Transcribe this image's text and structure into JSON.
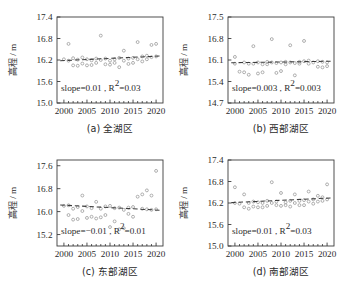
{
  "figure": {
    "panel_count": 4,
    "shared_ylabel": "高程 / m",
    "shared_xticks": [
      "2000",
      "2005",
      "2010",
      "2015",
      "2020"
    ]
  },
  "chart_data": [
    {
      "type": "scatter",
      "panel_id": "a",
      "caption": "(a) 全湖区",
      "title": "",
      "xlabel": "",
      "ylabel": "高程 / m",
      "xlim": [
        1998.5,
        2021.5
      ],
      "ylim": [
        15.0,
        17.4
      ],
      "xticks": [
        2000,
        2005,
        2010,
        2015,
        2020
      ],
      "xticklabels": [
        "2000",
        "2005",
        "2010",
        "2015",
        "2020"
      ],
      "yticks": [
        15.0,
        15.6,
        16.2,
        16.8,
        17.4
      ],
      "yticklabels": [
        "15.0",
        "15.6",
        "16.2",
        "16.8",
        "17.4"
      ],
      "grid": false,
      "legend": "none",
      "annotation": "slope=0.01 , R²=0.03",
      "annotation_parts": {
        "slope_label": "slope=",
        "slope_value": "0.01",
        "separator": " , ",
        "r_symbol": "R",
        "r_exponent": "2",
        "r_equals": "=",
        "r_value": "0.03"
      },
      "trendline": {
        "slope": 0.01,
        "r2": 0.03,
        "x": [
          1999.2,
          2020.8
        ],
        "y": [
          16.18,
          16.31
        ]
      },
      "x": [
        2000,
        2001,
        2001,
        2002,
        2002,
        2003,
        2003,
        2004,
        2004,
        2005,
        2005,
        2006,
        2006,
        2007,
        2007,
        2008,
        2008,
        2009,
        2009,
        2010,
        2010,
        2011,
        2011,
        2012,
        2012,
        2013,
        2013,
        2014,
        2014,
        2015,
        2015,
        2016,
        2016,
        2017,
        2017,
        2018,
        2018,
        2019,
        2019,
        2020,
        2020
      ],
      "y": [
        16.22,
        16.65,
        16.18,
        16.25,
        16.05,
        16.21,
        16.04,
        16.27,
        16.1,
        16.22,
        16.05,
        16.19,
        16.06,
        16.24,
        16.12,
        16.88,
        16.2,
        16.08,
        16.24,
        16.18,
        16.07,
        16.22,
        16.12,
        16.26,
        16.0,
        16.46,
        16.18,
        16.09,
        16.24,
        16.26,
        16.12,
        16.7,
        16.22,
        16.3,
        16.16,
        16.32,
        16.22,
        16.62,
        16.28,
        16.65,
        16.3
      ]
    },
    {
      "type": "scatter",
      "panel_id": "b",
      "caption": "(b) 西部湖区",
      "title": "",
      "xlabel": "",
      "ylabel": "高程 / m",
      "xlim": [
        1998.5,
        2021.5
      ],
      "ylim": [
        14.7,
        17.5
      ],
      "xticks": [
        2000,
        2005,
        2010,
        2015,
        2020
      ],
      "xticklabels": [
        "2000",
        "2005",
        "2010",
        "2015",
        "2020"
      ],
      "yticks": [
        14.7,
        15.4,
        16.1,
        16.8,
        17.5
      ],
      "yticklabels": [
        "14.7",
        "15.4",
        "16.1",
        "16.8",
        "17.5"
      ],
      "grid": false,
      "legend": "none",
      "annotation": "slope=0.003 , R²=0.003",
      "annotation_parts": {
        "slope_label": "slope=",
        "slope_value": "0.003",
        "separator": " , ",
        "r_symbol": "R",
        "r_exponent": "2",
        "r_equals": "=",
        "r_value": "0.003"
      },
      "trendline": {
        "slope": 0.003,
        "r2": 0.003,
        "x": [
          1999.2,
          2020.8
        ],
        "y": [
          16.01,
          16.06
        ]
      },
      "x": [
        2000,
        2000,
        2001,
        2002,
        2002,
        2003,
        2003,
        2004,
        2004,
        2005,
        2005,
        2006,
        2006,
        2007,
        2007,
        2008,
        2008,
        2009,
        2009,
        2010,
        2010,
        2011,
        2011,
        2012,
        2012,
        2013,
        2013,
        2014,
        2014,
        2015,
        2015,
        2016,
        2016,
        2017,
        2018,
        2018,
        2019,
        2019,
        2020,
        2020
      ],
      "y": [
        16.2,
        15.98,
        15.72,
        16.02,
        15.7,
        15.98,
        15.62,
        16.55,
        15.98,
        16.02,
        15.66,
        15.96,
        15.7,
        16.04,
        15.96,
        16.78,
        16.02,
        15.68,
        16.0,
        16.02,
        15.74,
        16.04,
        15.96,
        16.58,
        16.02,
        16.0,
        15.6,
        16.04,
        15.98,
        16.72,
        16.06,
        16.08,
        15.98,
        16.02,
        16.06,
        15.88,
        16.04,
        15.86,
        16.02,
        15.9
      ]
    },
    {
      "type": "scatter",
      "panel_id": "c",
      "caption": "(c) 东部湖区",
      "title": "",
      "xlabel": "",
      "ylabel": "高程 / m",
      "xlim": [
        1998.5,
        2021.5
      ],
      "ylim": [
        14.8,
        17.8
      ],
      "xticks": [
        2000,
        2005,
        2010,
        2015,
        2020
      ],
      "xticklabels": [
        "2000",
        "2005",
        "2010",
        "2015",
        "2020"
      ],
      "yticks": [
        15.2,
        16.0,
        16.8,
        17.6
      ],
      "yticklabels": [
        "15.2",
        "16.0",
        "16.8",
        "17.6"
      ],
      "grid": false,
      "legend": "none",
      "annotation": "slope=−0.01 , R²=0.01",
      "annotation_parts": {
        "slope_label": "slope=",
        "slope_value": "−0.01",
        "separator": " , ",
        "r_symbol": "R",
        "r_exponent": "2",
        "r_equals": "=",
        "r_value": "0.01"
      },
      "trendline": {
        "slope": -0.01,
        "r2": 0.01,
        "x": [
          1999.2,
          2020.8
        ],
        "y": [
          16.23,
          16.05
        ]
      },
      "x": [
        2000,
        2001,
        2001,
        2002,
        2002,
        2003,
        2003,
        2004,
        2004,
        2005,
        2005,
        2006,
        2006,
        2007,
        2007,
        2008,
        2008,
        2009,
        2009,
        2010,
        2010,
        2011,
        2011,
        2012,
        2012,
        2013,
        2013,
        2014,
        2014,
        2015,
        2015,
        2016,
        2017,
        2017,
        2018,
        2018,
        2019,
        2019,
        2020,
        2020
      ],
      "y": [
        16.2,
        16.22,
        15.88,
        16.1,
        15.72,
        16.16,
        15.74,
        16.56,
        16.02,
        16.18,
        15.78,
        16.12,
        15.82,
        16.34,
        15.76,
        16.1,
        15.8,
        16.18,
        15.88,
        16.2,
        15.46,
        16.12,
        15.66,
        16.14,
        15.38,
        16.06,
        15.42,
        16.14,
        15.92,
        16.16,
        15.82,
        16.52,
        16.6,
        16.1,
        16.74,
        16.08,
        16.56,
        16.06,
        17.42,
        16.08
      ]
    },
    {
      "type": "scatter",
      "panel_id": "d",
      "caption": "(d) 南部湖区",
      "title": "",
      "xlabel": "",
      "ylabel": "高程 / m",
      "xlim": [
        1998.5,
        2021.5
      ],
      "ylim": [
        15.0,
        17.4
      ],
      "xticks": [
        2000,
        2005,
        2010,
        2015,
        2020
      ],
      "xticklabels": [
        "2000",
        "2005",
        "2010",
        "2015",
        "2020"
      ],
      "yticks": [
        15.0,
        15.6,
        16.2,
        16.8,
        17.4
      ],
      "yticklabels": [
        "15.0",
        "15.6",
        "16.2",
        "16.8",
        "17.4"
      ],
      "grid": false,
      "legend": "none",
      "annotation": "slope=0.01 , R²=0.03",
      "annotation_parts": {
        "slope_label": "slope=",
        "slope_value": "0.01",
        "separator": " , ",
        "r_symbol": "R",
        "r_exponent": "2",
        "r_equals": "=",
        "r_value": "0.03"
      },
      "trendline": {
        "slope": 0.01,
        "r2": 0.03,
        "x": [
          1999.2,
          2020.8
        ],
        "y": [
          16.21,
          16.34
        ]
      },
      "x": [
        2000,
        2000,
        2001,
        2002,
        2002,
        2003,
        2003,
        2004,
        2004,
        2005,
        2005,
        2006,
        2006,
        2007,
        2007,
        2008,
        2008,
        2009,
        2009,
        2010,
        2010,
        2011,
        2011,
        2012,
        2012,
        2013,
        2013,
        2014,
        2014,
        2015,
        2015,
        2016,
        2016,
        2017,
        2017,
        2018,
        2018,
        2019,
        2019,
        2020,
        2020
      ],
      "y": [
        16.64,
        16.2,
        16.18,
        16.44,
        16.08,
        16.2,
        16.04,
        16.24,
        16.1,
        16.22,
        16.08,
        16.2,
        16.08,
        16.26,
        16.12,
        16.78,
        16.2,
        16.14,
        16.24,
        16.48,
        16.12,
        16.22,
        16.14,
        16.26,
        16.1,
        16.44,
        16.2,
        16.14,
        16.26,
        16.28,
        16.14,
        16.52,
        16.24,
        16.3,
        16.18,
        16.4,
        16.24,
        16.36,
        16.26,
        16.72,
        16.3
      ]
    }
  ]
}
